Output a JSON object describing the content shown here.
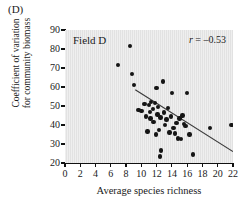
{
  "panel": {
    "letter": "(D)"
  },
  "axes": {
    "xlabel": "Average species richness",
    "ylabel_line1": "Coefficient of variation",
    "ylabel_line2": "for community biomass",
    "xticks": [
      0,
      2,
      4,
      6,
      8,
      10,
      12,
      14,
      16,
      18,
      20,
      22
    ],
    "yticks": [
      20,
      30,
      40,
      50,
      60,
      70,
      80,
      90
    ]
  },
  "annotations": {
    "series_label": "Field D",
    "corr_symbol": "r",
    "corr_text": " = –0.53"
  },
  "colors": {
    "plot_background": "#e2e2e2",
    "point": "#151515",
    "axis": "#111111",
    "fit_line": "#3a3a3a"
  },
  "chart_data": {
    "type": "scatter",
    "title": "Field D",
    "xlabel": "Average species richness",
    "ylabel": "Coefficient of variation for community biomass",
    "xlim": [
      0,
      22
    ],
    "ylim": [
      20,
      90
    ],
    "grid": false,
    "legend": "none",
    "correlation_r": -0.53,
    "annotation": "r = -0.53",
    "x": [
      6.9,
      8.5,
      8.8,
      9.0,
      9.6,
      10.0,
      10.4,
      10.6,
      10.8,
      11.0,
      11.1,
      11.2,
      11.3,
      11.5,
      11.6,
      11.8,
      11.9,
      12.0,
      12.1,
      12.2,
      12.3,
      12.4,
      12.5,
      12.6,
      12.8,
      13.0,
      13.1,
      13.3,
      13.5,
      13.7,
      13.9,
      14.0,
      14.2,
      14.4,
      14.6,
      14.8,
      15.0,
      15.2,
      15.4,
      15.6,
      15.8,
      16.0,
      16.3,
      16.8,
      19.0,
      21.8
    ],
    "y": [
      71.5,
      81.5,
      67.0,
      61.0,
      48.0,
      47.5,
      51.0,
      44.5,
      36.5,
      50.5,
      47.0,
      43.5,
      52.0,
      48.5,
      41.5,
      51.5,
      35.0,
      59.5,
      45.5,
      49.5,
      37.5,
      23.5,
      44.0,
      26.5,
      63.0,
      46.5,
      40.0,
      43.0,
      49.0,
      36.0,
      44.5,
      57.0,
      38.5,
      35.5,
      41.0,
      33.0,
      43.5,
      32.5,
      45.0,
      40.5,
      39.5,
      57.0,
      35.0,
      24.5,
      38.5,
      40.0
    ],
    "fit_line": {
      "x0": 9.2,
      "y0": 58.5,
      "x1": 22.0,
      "y1": 26.0
    }
  }
}
